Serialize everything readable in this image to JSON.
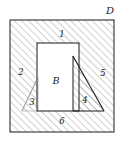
{
  "figure": {
    "type": "geometry-diagram",
    "domain_label": "D",
    "inner_region_label": "B",
    "boundary_labels": [
      "1",
      "2",
      "3",
      "4",
      "5",
      "6"
    ],
    "colors": {
      "stroke": "#1a1a1a",
      "hatch": "#8c8c8c",
      "fill_white": "#ffffff",
      "background": "#ffffff",
      "faint": "#b4b4b4"
    },
    "labels": [
      {
        "id": "domain-d",
        "text": "D",
        "x": 110,
        "y": 11,
        "kind": "domain"
      },
      {
        "id": "segment-1",
        "text": "1",
        "x": 62,
        "y": 34,
        "kind": "num"
      },
      {
        "id": "segment-2",
        "text": "2",
        "x": 21,
        "y": 72,
        "kind": "num"
      },
      {
        "id": "segment-3",
        "text": "3",
        "x": 32,
        "y": 102,
        "kind": "num"
      },
      {
        "id": "segment-4",
        "text": "4",
        "x": 85,
        "y": 100,
        "kind": "num"
      },
      {
        "id": "segment-5",
        "text": "5",
        "x": 103,
        "y": 73,
        "kind": "num"
      },
      {
        "id": "segment-6",
        "text": "6",
        "x": 62,
        "y": 121,
        "kind": "num"
      },
      {
        "id": "region-b",
        "text": "B",
        "x": 56,
        "y": 81,
        "kind": "region"
      }
    ],
    "shapes": {
      "outer_square": {
        "x": 10,
        "y": 20,
        "w": 104,
        "h": 112
      },
      "inner_rect": {
        "x": 37,
        "y": 43,
        "w": 42,
        "h": 68
      },
      "triangle_right": [
        [
          73,
          56
        ],
        [
          73,
          111
        ],
        [
          104,
          111
        ]
      ],
      "triangle_left": [
        [
          22,
          111
        ],
        [
          38,
          77
        ],
        [
          38,
          111
        ]
      ]
    }
  }
}
